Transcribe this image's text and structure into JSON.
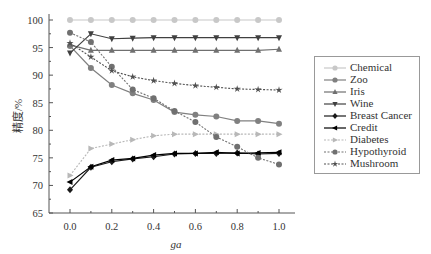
{
  "chart_data": {
    "type": "line",
    "title": "",
    "xlabel": "ga",
    "ylabel": "精度/%",
    "x": [
      0.0,
      0.1,
      0.2,
      0.3,
      0.4,
      0.5,
      0.6,
      0.7,
      0.8,
      0.9,
      1.0
    ],
    "xticks": [
      "0.0",
      "0.2",
      "0.4",
      "0.6",
      "0.8",
      "1.0"
    ],
    "yticks": [
      "65",
      "70",
      "75",
      "80",
      "85",
      "90",
      "95",
      "100"
    ],
    "xlim": [
      -0.13,
      1.07
    ],
    "ylim": [
      65,
      100
    ],
    "grid": false,
    "legend_position": "right",
    "series": [
      {
        "name": "Chemical",
        "color": "#c8c8c8",
        "marker": "circle",
        "dash": "solid",
        "values": [
          100,
          100,
          100,
          100,
          100,
          100,
          100,
          100,
          100,
          100,
          100
        ]
      },
      {
        "name": "Zoo",
        "color": "#808080",
        "marker": "circle",
        "dash": "solid",
        "values": [
          95.3,
          91.3,
          88.2,
          86.7,
          85.5,
          83.3,
          82.8,
          82.5,
          81.7,
          81.7,
          81.2
        ]
      },
      {
        "name": "Iris",
        "color": "#707070",
        "marker": "triangle-up",
        "dash": "solid",
        "values": [
          95.5,
          94.5,
          94.5,
          94.5,
          94.5,
          94.5,
          94.5,
          94.5,
          94.5,
          94.5,
          94.7
        ]
      },
      {
        "name": "Wine",
        "color": "#404040",
        "marker": "triangle-down",
        "dash": "solid",
        "values": [
          94.0,
          97.5,
          96.6,
          96.7,
          96.8,
          96.8,
          96.8,
          96.8,
          96.8,
          96.8,
          96.8
        ]
      },
      {
        "name": "Breast Cancer",
        "color": "#1a1a1a",
        "marker": "diamond",
        "dash": "solid",
        "values": [
          69.2,
          73.3,
          74.3,
          74.8,
          75.2,
          75.7,
          75.8,
          75.8,
          75.9,
          75.7,
          75.8
        ]
      },
      {
        "name": "Credit",
        "color": "#000000",
        "marker": "triangle-left",
        "dash": "solid",
        "values": [
          70.6,
          73.4,
          74.6,
          74.9,
          75.5,
          75.8,
          75.8,
          76.0,
          75.8,
          75.9,
          76.0
        ]
      },
      {
        "name": "Diabetes",
        "color": "#b8b8b8",
        "marker": "triangle-right",
        "dash": "dotted",
        "values": [
          71.8,
          76.7,
          77.5,
          78.3,
          79.0,
          79.3,
          79.3,
          79.3,
          79.3,
          79.3,
          79.3
        ]
      },
      {
        "name": "Hypothyroid",
        "color": "#707070",
        "marker": "circle",
        "dash": "dotted",
        "values": [
          97.7,
          96.0,
          91.5,
          87.4,
          85.8,
          83.5,
          81.5,
          78.8,
          77.0,
          75.0,
          73.8
        ]
      },
      {
        "name": "Mushroom",
        "color": "#505050",
        "marker": "star",
        "dash": "dotted",
        "values": [
          95.8,
          93.3,
          90.8,
          89.7,
          89.0,
          88.5,
          88.1,
          87.8,
          87.5,
          87.4,
          87.3
        ]
      }
    ]
  }
}
